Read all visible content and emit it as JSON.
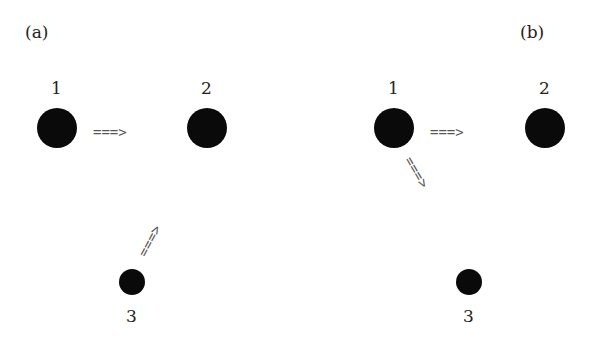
{
  "panels": [
    {
      "label": "(a)",
      "nodes": [
        {
          "id": "1",
          "label": "1"
        },
        {
          "id": "2",
          "label": "2"
        },
        {
          "id": "3",
          "label": "3"
        }
      ],
      "arrows": [
        {
          "from": "1",
          "to": "2",
          "glyph": "===>"
        },
        {
          "from": "3",
          "to": "2",
          "glyph": "===>"
        }
      ]
    },
    {
      "label": "(b)",
      "nodes": [
        {
          "id": "1",
          "label": "1"
        },
        {
          "id": "2",
          "label": "2"
        },
        {
          "id": "3",
          "label": "3"
        }
      ],
      "arrows": [
        {
          "from": "1",
          "to": "2",
          "glyph": "===>"
        },
        {
          "from": "1",
          "to": "3",
          "glyph": "===>"
        }
      ]
    }
  ],
  "colors": {
    "node": "#0a0a0a",
    "arrow": "#555555",
    "text": "#222222"
  }
}
